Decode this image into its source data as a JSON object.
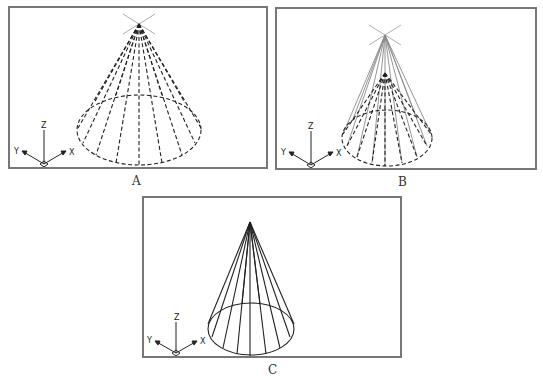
{
  "figure": {
    "panels": [
      {
        "id": "A",
        "caption": "A",
        "description": "Cone with dashed generator lines and dashed base ellipse; apex marked with X-shaped grip cross",
        "axes": {
          "x": "X",
          "y": "Y",
          "z": "Z"
        }
      },
      {
        "id": "B",
        "caption": "B",
        "description": "Cone being stretched: gray solid lines to relocated apex cross above, dashed original cone beneath",
        "axes": {
          "x": "X",
          "y": "Y",
          "z": "Z"
        }
      },
      {
        "id": "C",
        "caption": "C",
        "description": "Final taller cone with solid generator lines and solid base ellipse",
        "axes": {
          "x": "X",
          "y": "Y",
          "z": "Z"
        }
      }
    ],
    "colors": {
      "frame": "#777777",
      "lines": "#222222",
      "ghost_lines": "#888888",
      "background": "#ffffff"
    }
  }
}
